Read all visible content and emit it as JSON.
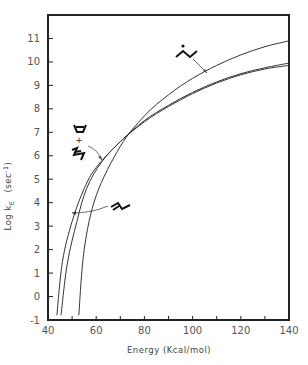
{
  "chart_data": {
    "type": "line",
    "title": "",
    "xlabel": "Energy (kcal/mol)",
    "ylabel": "Log k_E (sec^-1)",
    "xlim": [
      40,
      140
    ],
    "ylim": [
      -1,
      12
    ],
    "x_ticks": [
      40,
      60,
      80,
      100,
      120,
      140
    ],
    "x_minor_ticks": [
      50,
      70,
      90,
      110,
      130
    ],
    "y_ticks": [
      -1,
      0,
      1,
      2,
      3,
      4,
      5,
      6,
      7,
      8,
      9,
      10,
      11
    ],
    "grid": false,
    "legend": "none (curves labeled with molecular structure drawings and leader arrows)",
    "series": [
      {
        "name": "radical (dot over zigzag structure)",
        "label_position": "upper middle, arrow to curve near E=106",
        "x": [
          52.8,
          55,
          60,
          70,
          80,
          90,
          100,
          110,
          120,
          130,
          140
        ],
        "y": [
          -0.8,
          2.0,
          4.3,
          6.4,
          7.7,
          8.6,
          9.3,
          9.85,
          10.3,
          10.65,
          10.9
        ]
      },
      {
        "name": "alkene (zigzag with double bond)",
        "label_position": "lower left, arrow to curve near E=52",
        "x": [
          43.7,
          46,
          50,
          55,
          60,
          70,
          80,
          90,
          100,
          110,
          120,
          130,
          140
        ],
        "y": [
          -0.8,
          1.5,
          3.2,
          4.6,
          5.5,
          6.6,
          7.5,
          8.15,
          8.7,
          9.15,
          9.5,
          9.75,
          9.95
        ]
      },
      {
        "name": "diene + cyclobutene",
        "label_position": "left middle, arrow to curve near E=64",
        "x": [
          45.4,
          48,
          52,
          56,
          62,
          70,
          80,
          90,
          100,
          110,
          120,
          130,
          140
        ],
        "y": [
          -0.8,
          1.4,
          3.2,
          4.6,
          5.7,
          6.6,
          7.45,
          8.1,
          8.65,
          9.1,
          9.45,
          9.7,
          9.85
        ]
      }
    ],
    "annotations": [
      {
        "text": "radical structure",
        "near": [
          95,
          11.2
        ]
      },
      {
        "text": "diene + cyclobutene structures",
        "near": [
          56,
          6.5
        ]
      },
      {
        "text": "alkene structure",
        "near": [
          67,
          3.0
        ]
      }
    ]
  },
  "labels": {
    "x_axis_title": "Energy (Kcal/mol)",
    "y_axis_title_main": "Log k",
    "y_axis_title_sub": "E",
    "y_axis_title_units": "(sec",
    "y_axis_title_exp": "-1",
    "y_axis_title_close": ")",
    "plus_sign": "+"
  }
}
